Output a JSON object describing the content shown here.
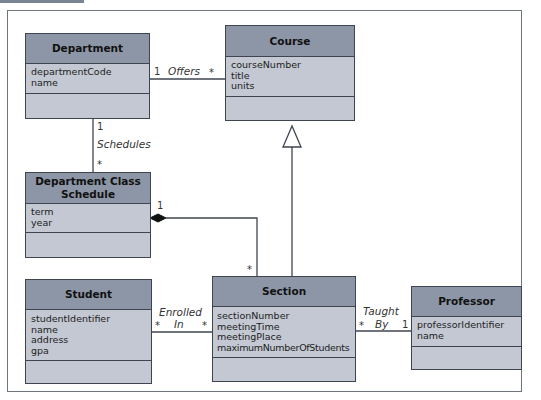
{
  "diagram": {
    "type": "UML class diagram",
    "classes": [
      {
        "id": "department",
        "name": "Department",
        "attributes": [
          "departmentCode",
          "name"
        ],
        "operations": []
      },
      {
        "id": "course",
        "name": "Course",
        "attributes": [
          "courseNumber",
          "title",
          "units"
        ],
        "operations": []
      },
      {
        "id": "schedule",
        "name": "Department Class Schedule",
        "attributes": [
          "term",
          "year"
        ],
        "operations": []
      },
      {
        "id": "student",
        "name": "Student",
        "attributes": [
          "studentIdentifier",
          "name",
          "address",
          "gpa"
        ],
        "operations": []
      },
      {
        "id": "section",
        "name": "Section",
        "attributes": [
          "sectionNumber",
          "meetingTime",
          "meetingPlace",
          "maximumNumberOfStudents"
        ],
        "operations": []
      },
      {
        "id": "professor",
        "name": "Professor",
        "attributes": [
          "professorIdentifier",
          "name"
        ],
        "operations": []
      }
    ],
    "relationships": [
      {
        "from": "department",
        "to": "course",
        "label": "Offers",
        "from_mult": "1",
        "to_mult": "*",
        "kind": "association"
      },
      {
        "from": "department",
        "to": "schedule",
        "label": "Schedules",
        "from_mult": "1",
        "to_mult": "*",
        "kind": "association"
      },
      {
        "from": "schedule",
        "to": "section",
        "label": "",
        "from_mult": "1",
        "to_mult": "*",
        "kind": "composition"
      },
      {
        "from": "section",
        "to": "course",
        "label": "",
        "kind": "generalization"
      },
      {
        "from": "student",
        "to": "section",
        "label": "Enrolled In",
        "label_lines": [
          "Enrolled",
          "In"
        ],
        "from_mult": "*",
        "to_mult": "*",
        "kind": "association"
      },
      {
        "from": "section",
        "to": "professor",
        "label": "Taught By",
        "label_lines": [
          "Taught",
          "By"
        ],
        "from_mult": "*",
        "to_mult": "1",
        "kind": "association"
      }
    ]
  }
}
